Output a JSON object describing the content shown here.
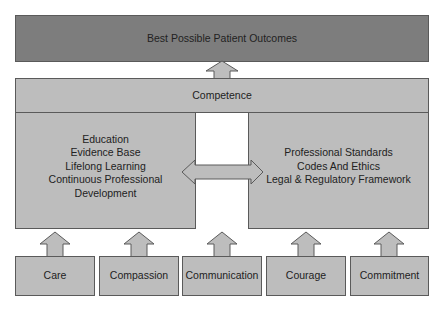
{
  "diagram": {
    "top": {
      "label": "Best Possible Patient Outcomes"
    },
    "band": {
      "label": "Competence"
    },
    "left": {
      "lines": [
        "Education",
        "Evidence Base",
        "Lifelong Learning",
        "Continuous Professional",
        "Development"
      ]
    },
    "right": {
      "lines": [
        "Professional Standards",
        "Codes And Ethics",
        "Legal & Regulatory Framework"
      ]
    },
    "values": [
      {
        "label": "Care"
      },
      {
        "label": "Compassion"
      },
      {
        "label": "Communication"
      },
      {
        "label": "Courage"
      },
      {
        "label": "Commitment"
      }
    ],
    "colors": {
      "top_fill": "#7d7d7d",
      "box_fill": "#bdbdbd",
      "border": "#5a5a5a"
    }
  }
}
